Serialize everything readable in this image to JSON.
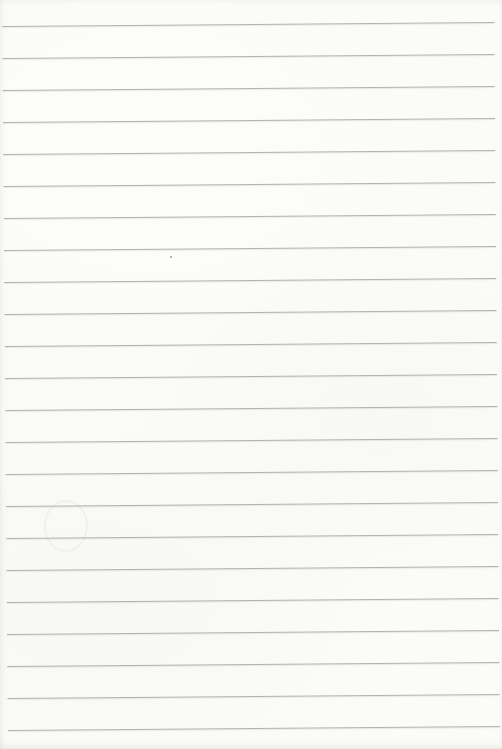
{
  "page": {
    "type": "blank-ruled-notebook-page",
    "content_text": "",
    "paper_color": "#fbfbf8",
    "line_color": "#b2b2ae",
    "edge_shadow_color": "#e6e6e1",
    "ruling": {
      "line_count": 23,
      "first_line_y": 24,
      "spacing_px": 32,
      "line_left_px": 5,
      "line_right_px": 497,
      "tilt_deg": -0.45
    },
    "marks": {
      "speck": {
        "x": 170,
        "y": 256,
        "size": 2,
        "color": "#9c9c99"
      },
      "ghost_ring": {
        "x": 44,
        "y": 500,
        "width": 40,
        "height": 48
      }
    }
  }
}
